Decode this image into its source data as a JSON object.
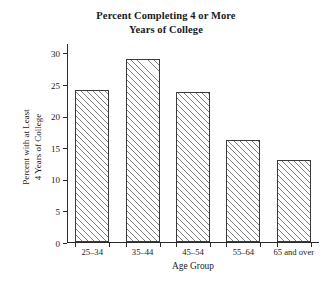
{
  "chart_data": {
    "type": "bar",
    "title": "Percent Completing 4 or More Years of College",
    "title_line1": "Percent Completing 4 or More",
    "title_line2": "Years of College",
    "xlabel": "Age Group",
    "ylabel": "Percent with at Least 4 Years of College",
    "ylabel_line1": "Percent with at Least",
    "ylabel_line2": "4 Years of College",
    "categories": [
      "25–34",
      "35–44",
      "45–54",
      "55–64",
      "65 and over"
    ],
    "values": [
      24,
      29,
      23.7,
      16.1,
      13
    ],
    "ylim": [
      0,
      31.5
    ],
    "yticks": [
      0,
      5,
      10,
      15,
      20,
      25,
      30
    ],
    "ytick_labels": [
      "0",
      "5",
      "10",
      "15",
      "20",
      "25",
      "30"
    ],
    "grid": false,
    "legend": null,
    "bar_fill": "hatched-diagonal",
    "bar_edge_color": "#3a3a3a",
    "hatch_color": "#808080",
    "axis_color": "#2b2b2b",
    "background": "#ffffff"
  }
}
